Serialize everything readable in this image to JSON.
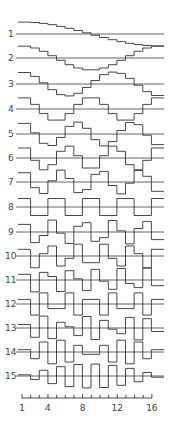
{
  "figure": {
    "type": "DCT basis functions (step plots)",
    "n_points": 16,
    "colors": {
      "line": "#333333",
      "background": "#ffffff"
    }
  },
  "rows": [
    {
      "label": "1",
      "k": 1,
      "baseline_y": 34
    },
    {
      "label": "2",
      "k": 2,
      "baseline_y": 58
    },
    {
      "label": "3",
      "k": 3,
      "baseline_y": 84
    },
    {
      "label": "4",
      "k": 4,
      "baseline_y": 109
    },
    {
      "label": "5",
      "k": 5,
      "baseline_y": 134
    },
    {
      "label": "6",
      "k": 6,
      "baseline_y": 158
    },
    {
      "label": "7",
      "k": 7,
      "baseline_y": 182
    },
    {
      "label": "8",
      "k": 8,
      "baseline_y": 207
    },
    {
      "label": "9",
      "k": 9,
      "baseline_y": 232
    },
    {
      "label": "10",
      "k": 10,
      "baseline_y": 256
    },
    {
      "label": "11",
      "k": 11,
      "baseline_y": 280
    },
    {
      "label": "12",
      "k": 12,
      "baseline_y": 304
    },
    {
      "label": "13",
      "k": 13,
      "baseline_y": 328
    },
    {
      "label": "14",
      "k": 14,
      "baseline_y": 352
    },
    {
      "label": "15",
      "k": 15,
      "baseline_y": 376
    }
  ],
  "axis": {
    "ticks": 16,
    "tick_labels": [
      {
        "value": 1,
        "text": "1"
      },
      {
        "value": 4,
        "text": "4"
      },
      {
        "value": 8,
        "text": "8"
      },
      {
        "value": 12,
        "text": "12"
      },
      {
        "value": 16,
        "text": "16"
      }
    ]
  }
}
